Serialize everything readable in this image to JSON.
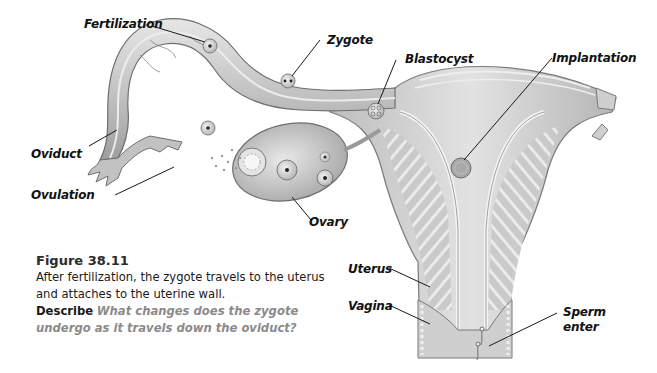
{
  "diagram": {
    "labels": {
      "fertilization": "Fertilization",
      "zygote": "Zygote",
      "blastocyst": "Blastocyst",
      "implantation": "Implantation",
      "oviduct": "Oviduct",
      "ovulation": "Ovulation",
      "ovary": "Ovary",
      "uterus": "Uterus",
      "vagina": "Vagina",
      "sperm_enter_line1": "Sperm",
      "sperm_enter_line2": "enter"
    },
    "colors": {
      "tissue_light": "#d9d9d9",
      "tissue_mid": "#bdbdbd",
      "tissue_dark": "#8f8f8f",
      "outline": "#6e6e6e",
      "leader_line": "#1a1a1a",
      "question_text": "#8a8a8a"
    }
  },
  "caption": {
    "figure_number": "Figure 38.11",
    "description": "After fertilization, the zygote travels to the uterus and attaches to the uterine wall.",
    "prompt_verb": "Describe",
    "question": "What changes does the zygote undergo as it travels down the oviduct?"
  }
}
